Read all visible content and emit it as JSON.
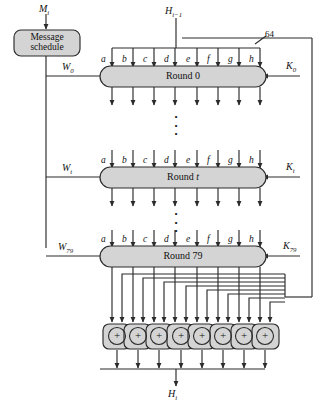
{
  "figure": {
    "type": "block-diagram"
  },
  "inputs": {
    "message_block": "M",
    "message_block_sub": "i",
    "chaining_in": "H",
    "chaining_in_sub": "i−1",
    "bitwidth_tag": "64"
  },
  "output": {
    "chaining_out": "H",
    "chaining_out_sub": "i"
  },
  "message_schedule": {
    "line1": "Message",
    "line2": "schedule"
  },
  "rounds": [
    {
      "name": "Round 0",
      "w": "W",
      "w_sub": "0",
      "k": "K",
      "k_sub": "0"
    },
    {
      "name": "Round t",
      "w": "W",
      "w_sub": "t",
      "k": "K",
      "k_sub": "t"
    },
    {
      "name": "Round 79",
      "w": "W",
      "w_sub": "79",
      "k": "K",
      "k_sub": "79"
    }
  ],
  "state_labels": [
    "a",
    "b",
    "c",
    "d",
    "e",
    "f",
    "g",
    "h"
  ],
  "adders": {
    "symbol": "+",
    "count": 8,
    "operation": "word-wise modular addition"
  },
  "ellipsis": {
    "glyph": "•",
    "count": 3,
    "meaning": "rounds continue"
  },
  "colors": {
    "block_fill": "#d4d4d4",
    "block_stroke": "#2b2b2b",
    "line": "#2b2b2b",
    "text": "#111111",
    "background": "#ffffff"
  }
}
